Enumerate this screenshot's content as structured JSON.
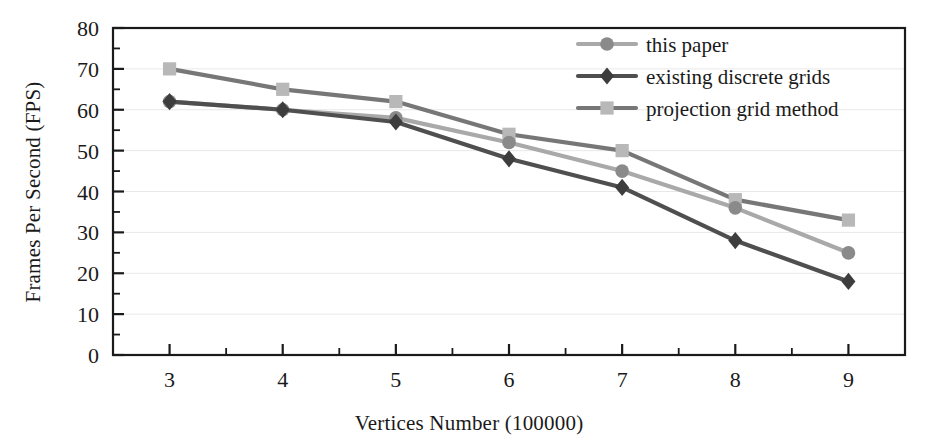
{
  "chart_data": {
    "type": "line",
    "title": "",
    "xlabel": "Vertices Number (100000)",
    "ylabel": "Frames Per Second (FPS)",
    "x": [
      3,
      4,
      5,
      6,
      7,
      8,
      9
    ],
    "xtick_labels": [
      "3",
      "4",
      "5",
      "6",
      "7",
      "8",
      "9"
    ],
    "ytick_labels": [
      "0",
      "10",
      "20",
      "30",
      "40",
      "50",
      "60",
      "70",
      "80"
    ],
    "yticks": [
      0,
      10,
      20,
      30,
      40,
      50,
      60,
      70,
      80
    ],
    "xlim": [
      2.5,
      9.5
    ],
    "ylim": [
      0,
      80
    ],
    "grid": true,
    "grid_axis": "y",
    "legend_position": "top-right",
    "minor_ticks": true,
    "series": [
      {
        "name": "this paper",
        "marker": "circle",
        "line_color": "#a9a9a9",
        "marker_color": "#8a8a8a",
        "values": [
          62,
          60,
          58,
          52,
          45,
          36,
          25
        ]
      },
      {
        "name": "existing discrete grids",
        "marker": "diamond",
        "line_color": "#4f4f4f",
        "marker_color": "#3d3d3d",
        "values": [
          62,
          60,
          57,
          48,
          41,
          28,
          18
        ]
      },
      {
        "name": "projection grid method",
        "marker": "square",
        "line_color": "#777777",
        "marker_color": "#b8b8b8",
        "values": [
          70,
          65,
          62,
          54,
          50,
          38,
          33
        ]
      }
    ]
  },
  "axes": {
    "frame_color": "#1a1a1a",
    "grid_color": "#e8e8e8",
    "background": "#ffffff"
  }
}
